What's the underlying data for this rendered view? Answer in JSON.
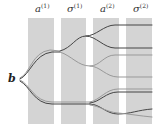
{
  "diagram": {
    "input_label": "b",
    "columns": [
      {
        "base": "a",
        "sup": "(1)"
      },
      {
        "base": "σ",
        "sup": "(1)"
      },
      {
        "base": "a",
        "sup": "(2)"
      },
      {
        "base": "σ",
        "sup": "(2)"
      }
    ],
    "colors": {
      "panel": "#d4d4d4",
      "line_dark": "#444444",
      "line_light": "#999999"
    }
  }
}
